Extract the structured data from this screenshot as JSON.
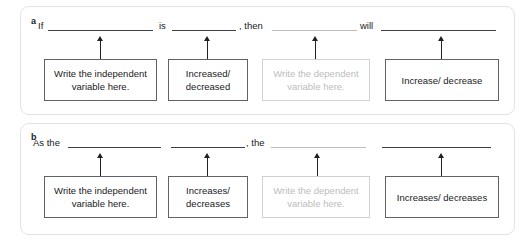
{
  "panels": [
    {
      "letter": "a",
      "sentence_words": [
        {
          "text": "If",
          "x": 38
        },
        {
          "text": "is",
          "x": 159
        },
        {
          "text": ", then",
          "x": 239
        },
        {
          "text": "will",
          "x": 360
        }
      ],
      "blanks": [
        {
          "x": 48,
          "width": 105,
          "tone": "dark"
        },
        {
          "x": 172,
          "width": 64,
          "tone": "dark"
        },
        {
          "x": 272,
          "width": 85,
          "tone": "light"
        },
        {
          "x": 381,
          "width": 115,
          "tone": "dark"
        }
      ],
      "arrows": [
        {
          "x": 100
        },
        {
          "x": 207
        },
        {
          "x": 315
        },
        {
          "x": 441
        }
      ],
      "boxes": [
        {
          "label": "Write the independent variable here.",
          "x": 44,
          "width": 113,
          "muted": false
        },
        {
          "label": "Increased/ decreased",
          "x": 168,
          "width": 80,
          "muted": false
        },
        {
          "label": "Write the dependent variable here.",
          "x": 262,
          "width": 108,
          "muted": true
        },
        {
          "label": "Increase/ decrease",
          "x": 385,
          "width": 114,
          "muted": false
        }
      ]
    },
    {
      "letter": "b",
      "sentence_words": [
        {
          "text": "As the",
          "x": 33
        },
        {
          "text": ", the",
          "x": 246
        }
      ],
      "blanks": [
        {
          "x": 68,
          "width": 93,
          "tone": "dark"
        },
        {
          "x": 171,
          "width": 74,
          "tone": "dark"
        },
        {
          "x": 271,
          "width": 95,
          "tone": "light"
        },
        {
          "x": 382,
          "width": 109,
          "tone": "dark"
        }
      ],
      "arrows": [
        {
          "x": 100
        },
        {
          "x": 207
        },
        {
          "x": 317
        },
        {
          "x": 441
        }
      ],
      "boxes": [
        {
          "label": "Write the independent variable here.",
          "x": 44,
          "width": 113,
          "muted": false
        },
        {
          "label": "Increases/ decreases",
          "x": 168,
          "width": 80,
          "muted": false
        },
        {
          "label": "Write the dependent variable here.",
          "x": 262,
          "width": 108,
          "muted": true
        },
        {
          "label": "Increases/ decreases",
          "x": 385,
          "width": 114,
          "muted": false
        }
      ]
    }
  ],
  "colors": {
    "card_border": "#e2e2e2",
    "text": "#202124",
    "muted": "#bdbdbd",
    "box_border": "#5f6368",
    "muted_box_border": "#d0d0d0",
    "background": "#ffffff"
  },
  "labels": {
    "panel_a_letter": "a",
    "panel_b_letter": "b",
    "independent_box": "Write the independent variable here.",
    "dependent_box": "Write the dependent variable here.",
    "increased_decreased": "Increased/ decreased",
    "increase_decrease": "Increase/ decrease",
    "increases_decreases": "Increases/ decreases",
    "word_if": "If",
    "word_is": "is",
    "word_then": ", then",
    "word_will": "will",
    "word_as_the": "As the",
    "word_the": ", the"
  }
}
